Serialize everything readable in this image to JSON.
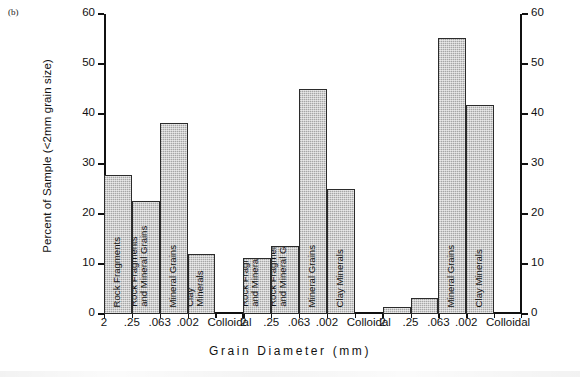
{
  "figure": {
    "panel_label": "(b)"
  },
  "chart_data": {
    "type": "bar",
    "title": "",
    "xlabel": "Grain  Diameter  (mm)",
    "ylabel": "Percent of Sample (<2mm grain size)",
    "ylim": [
      0,
      60
    ],
    "yticks": [
      0,
      10,
      20,
      30,
      40,
      50,
      60
    ],
    "ytick_labels": [
      "0",
      "10",
      "20",
      "30",
      "40",
      "50",
      "60"
    ],
    "right_axis": true,
    "right_ytick_labels": [
      "0",
      "10",
      "20",
      "30",
      "40",
      "50",
      "60"
    ],
    "grid": false,
    "legend": "none",
    "categories": [
      "2",
      ".25",
      ".063",
      ".002",
      "Colloidal"
    ],
    "groups": [
      {
        "name": "group-1",
        "bars": [
          {
            "category": "2",
            "value": 27.8,
            "label": "Rock Fragments"
          },
          {
            "category": ".25",
            "value": 22.7,
            "label": "Rock Fragments\nand Mineral Grains"
          },
          {
            "category": ".063",
            "value": 38.2,
            "label": "Mineral Grains"
          },
          {
            "category": ".002",
            "value": 12.0,
            "label": "Clay\nMinerals"
          },
          {
            "category": "Colloidal",
            "value": 0,
            "label": ""
          }
        ]
      },
      {
        "name": "group-2",
        "bars": [
          {
            "category": "2",
            "value": 11.2,
            "label": "Rock Fragments\nand Mineral Grains"
          },
          {
            "category": ".25",
            "value": 13.6,
            "label": "Rock Fragments\nand Mineral Grains"
          },
          {
            "category": ".063",
            "value": 45.0,
            "label": "Mineral Grains"
          },
          {
            "category": ".002",
            "value": 25.0,
            "label": "Clay Minerals"
          },
          {
            "category": "Colloidal",
            "value": 0,
            "label": ""
          }
        ]
      },
      {
        "name": "group-3",
        "bars": [
          {
            "category": "2",
            "value": 1.5,
            "label": ""
          },
          {
            "category": ".25",
            "value": 3.2,
            "label": ""
          },
          {
            "category": ".063",
            "value": 55.2,
            "label": "Mineral Grains"
          },
          {
            "category": ".002",
            "value": 41.8,
            "label": "Clay Minerals"
          },
          {
            "category": "Colloidal",
            "value": 0,
            "label": ""
          }
        ]
      }
    ],
    "xtick_groups": [
      [
        "2",
        ".25",
        ".063",
        ".002",
        "Colloidal"
      ],
      [
        "2",
        ".25",
        ".063",
        ".002",
        "Colloidal"
      ],
      [
        "2",
        ".25",
        ".063",
        ".002",
        "Colloidal"
      ]
    ]
  },
  "style": {
    "bar_fill": "#b9b9b9",
    "bar_edge": "#2b2b2b",
    "axis_color": "#111111",
    "background": "#ffffff"
  }
}
